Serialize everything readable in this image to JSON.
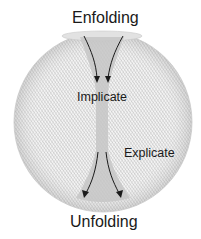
{
  "diagram": {
    "labels": {
      "top": "Enfolding",
      "center": "Implicate",
      "right": "Explicate",
      "bottom": "Unfolding"
    },
    "shape": "torus-sphere",
    "colors": {
      "line": "#b8b8b8",
      "funnel": "#c4c4c4",
      "arrow": "#1a1a1a",
      "text": "#1a1a1a"
    }
  }
}
